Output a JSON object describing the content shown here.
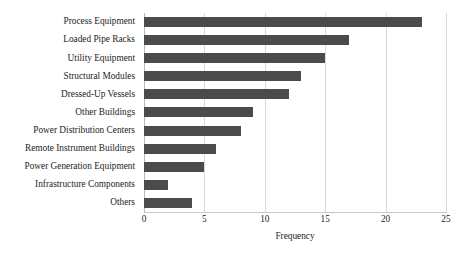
{
  "chart_data": {
    "type": "bar",
    "orientation": "horizontal",
    "title": "",
    "xlabel": "Frequency",
    "ylabel": "",
    "categories": [
      "Process Equipment",
      "Loaded Pipe Racks",
      "Utility Equipment",
      "Structural Modules",
      "Dressed-Up Vessels",
      "Other Buildings",
      "Power Distribution Centers",
      "Remote Instrument Buildings",
      "Power Generation Equipment",
      "Infrastructure Components",
      "Others"
    ],
    "values": [
      23,
      17,
      15,
      13,
      12,
      9,
      8,
      6,
      5,
      2,
      4
    ],
    "xlim": [
      0,
      25
    ],
    "xticks": [
      0,
      5,
      10,
      15,
      20,
      25
    ],
    "xtick_labels": [
      "0",
      "5",
      "10",
      "15",
      "20",
      "25"
    ],
    "grid": "vertical",
    "legend": "none",
    "bar_color": "#4b4b4b",
    "gridline_color": "#d9d9d9",
    "background_color": "#ffffff"
  }
}
